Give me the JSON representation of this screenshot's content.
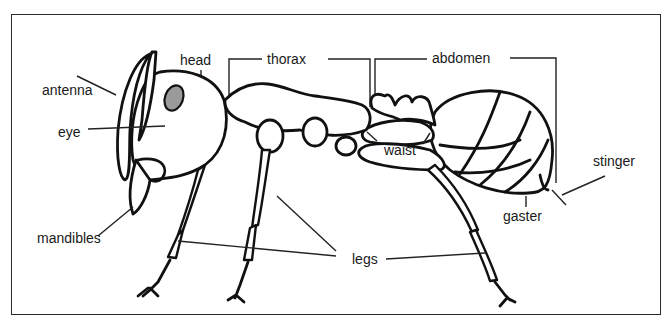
{
  "diagram": {
    "labels": {
      "head": "head",
      "thorax": "thorax",
      "abdomen": "abdomen",
      "antenna": "antenna",
      "eye": "eye",
      "waist": "waist",
      "stinger": "stinger",
      "mandibles": "mandibles",
      "gaster": "gaster",
      "legs": "legs"
    },
    "colors": {
      "line": "#111111",
      "eye_fill": "#9a9a9a",
      "background": "#ffffff"
    }
  }
}
